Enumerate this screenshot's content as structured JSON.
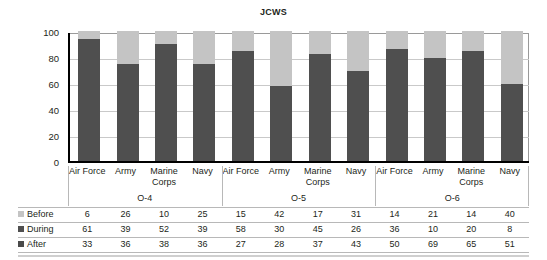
{
  "chart_data": {
    "type": "bar",
    "title": "JCWS",
    "xlabel": "",
    "ylabel": "Percentage",
    "ylim": [
      0,
      100
    ],
    "yticks": [
      100,
      80,
      60,
      40,
      20,
      0
    ],
    "grid": true,
    "stacked": true,
    "legend_position": "table-left",
    "groups": [
      {
        "label": "O-4",
        "categories": [
          "Air Force",
          "Army",
          "Marine Corps",
          "Navy"
        ]
      },
      {
        "label": "O-5",
        "categories": [
          "Air Force",
          "Army",
          "Marine Corps",
          "Navy"
        ]
      },
      {
        "label": "O-6",
        "categories": [
          "Air Force",
          "Army",
          "Marine Corps",
          "Navy"
        ]
      }
    ],
    "categories": [
      "Air Force",
      "Army",
      "Marine Corps",
      "Navy",
      "Air Force",
      "Army",
      "Marine Corps",
      "Navy",
      "Air Force",
      "Army",
      "Marine Corps",
      "Navy"
    ],
    "series": [
      {
        "name": "Before",
        "color": "#c4c4c4",
        "values": [
          6,
          26,
          10,
          25,
          15,
          42,
          17,
          31,
          14,
          21,
          14,
          40
        ]
      },
      {
        "name": "During",
        "color": "#4f4f4f",
        "values": [
          61,
          39,
          52,
          39,
          58,
          30,
          45,
          26,
          36,
          10,
          20,
          8
        ]
      },
      {
        "name": "After",
        "color": "#4f4f4f",
        "values": [
          33,
          36,
          38,
          36,
          27,
          28,
          37,
          43,
          50,
          69,
          65,
          51
        ]
      }
    ],
    "rendered_stack_order_bottom_to_top": [
      "After",
      "During",
      "Before"
    ],
    "bar_totals_dark_bottom": [
      94,
      75,
      90,
      75,
      85,
      58,
      82,
      69,
      86,
      79,
      85,
      59
    ],
    "colors": {
      "dark": "#4f4f4f",
      "light": "#c4c4c4",
      "grid": "#c9c9c9",
      "axis": "#000000",
      "text": "#231f20",
      "rule": "#b8b8b8"
    }
  },
  "legend": {
    "rows": [
      {
        "label": "Before",
        "swatch": "#c4c4c4",
        "icon": "legend-square-icon"
      },
      {
        "label": "During",
        "swatch": "#4f4f4f",
        "icon": "legend-square-icon"
      },
      {
        "label": "After",
        "swatch": "#4a4a4a",
        "icon": "legend-square-icon"
      }
    ]
  }
}
